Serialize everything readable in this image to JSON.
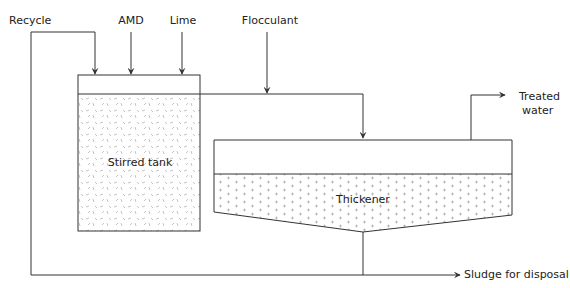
{
  "diagram": {
    "inputs": {
      "recycle": "Recycle",
      "amd": "AMD",
      "lime": "Lime",
      "flocculant": "Flocculant"
    },
    "units": {
      "stirred_tank": "Stirred tank",
      "thickener": "Thickener"
    },
    "outputs": {
      "treated_line1": "Treated",
      "treated_line2": "water",
      "sludge": "Sludge for disposal"
    },
    "colors": {
      "line": "#333333",
      "fill_texture": "#aaaaaa",
      "background": "#ffffff"
    }
  }
}
